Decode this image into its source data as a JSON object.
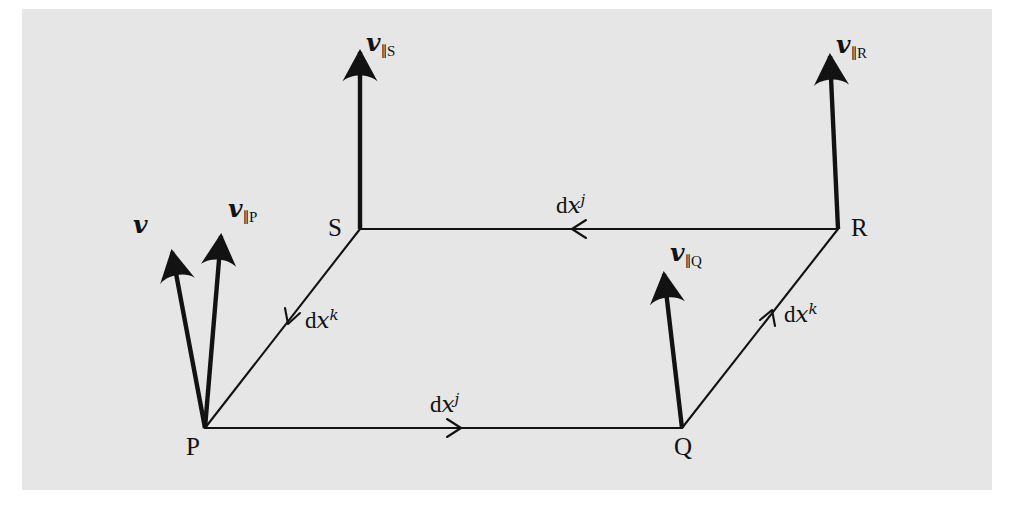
{
  "figure": {
    "kind": "parallel-transport-loop-diagram",
    "background_page_color": "#e6e6e6",
    "canvas_color": "#ffffff",
    "ink_color": "#121212",
    "width": 1011,
    "height": 505
  },
  "vertices": [
    {
      "id": "P",
      "label": "P",
      "x": 205,
      "y": 428,
      "label_x": 186,
      "label_y": 434
    },
    {
      "id": "Q",
      "label": "Q",
      "x": 682,
      "y": 428,
      "label_x": 674,
      "label_y": 434
    },
    {
      "id": "R",
      "label": "R",
      "x": 838,
      "y": 229,
      "label_x": 851,
      "label_y": 215
    },
    {
      "id": "S",
      "label": "S",
      "x": 360,
      "y": 229,
      "label_x": 328,
      "label_y": 215
    }
  ],
  "edges": [
    {
      "id": "PQ",
      "from": "P",
      "to": "Q",
      "label": "dx^j",
      "direction": "P-to-Q",
      "arrow_at_x": 460,
      "arrow_at_y": 428
    },
    {
      "id": "SR",
      "from": "R",
      "to": "S",
      "label": "dx^j",
      "direction": "R-to-S",
      "arrow_at_x": 573,
      "arrow_at_y": 229
    },
    {
      "id": "PS",
      "from": "S",
      "to": "P",
      "label": "dx^k",
      "direction": "S-to-P",
      "arrow_at_x": 288,
      "arrow_at_y": 323
    },
    {
      "id": "QR",
      "from": "Q",
      "to": "R",
      "label": "dx^k",
      "direction": "Q-to-R",
      "arrow_at_x": 772,
      "arrow_at_y": 316
    }
  ],
  "edge_labels": [
    {
      "id": "dxj-bottom",
      "d": "d",
      "x": "x",
      "index": "j",
      "pos_x": 430,
      "pos_y": 392
    },
    {
      "id": "dxj-top",
      "d": "d",
      "x": "x",
      "index": "j",
      "pos_x": 556,
      "pos_y": 193
    },
    {
      "id": "dxk-left",
      "d": "d",
      "x": "x",
      "index": "k",
      "pos_x": 305,
      "pos_y": 308
    },
    {
      "id": "dxk-right",
      "d": "d",
      "x": "x",
      "index": "k",
      "pos_x": 784,
      "pos_y": 302
    }
  ],
  "vectors": [
    {
      "id": "v-at-P",
      "symbol": "v",
      "subscript_bar": "",
      "subscript_point": "",
      "tail_x": 205,
      "tail_y": 428,
      "tip_x": 169,
      "tip_y": 238,
      "label_x": 133,
      "label_y": 212,
      "description": "original vector v at P"
    },
    {
      "id": "v-parallel-P",
      "symbol": "v",
      "subscript_bar": "∥",
      "subscript_point": "P",
      "tail_x": 205,
      "tail_y": 428,
      "tip_x": 222,
      "tip_y": 222,
      "label_x": 228,
      "label_y": 196,
      "description": "parallel transported vector at P"
    },
    {
      "id": "v-parallel-Q",
      "symbol": "v",
      "subscript_bar": "∥",
      "subscript_point": "Q",
      "tail_x": 682,
      "tail_y": 428,
      "tip_x": 663,
      "tip_y": 260,
      "label_x": 670,
      "label_y": 240,
      "description": "parallel transported vector at Q"
    },
    {
      "id": "v-parallel-S",
      "symbol": "v",
      "subscript_bar": "∥",
      "subscript_point": "S",
      "tail_x": 360,
      "tail_y": 229,
      "tip_x": 360,
      "tip_y": 38,
      "label_x": 366,
      "label_y": 30,
      "description": "parallel transported vector at S"
    },
    {
      "id": "v-parallel-R",
      "symbol": "v",
      "subscript_bar": "∥",
      "subscript_point": "R",
      "tail_x": 838,
      "tail_y": 229,
      "tip_x": 829,
      "tip_y": 42,
      "label_x": 836,
      "label_y": 32,
      "description": "parallel transported vector at R"
    }
  ]
}
